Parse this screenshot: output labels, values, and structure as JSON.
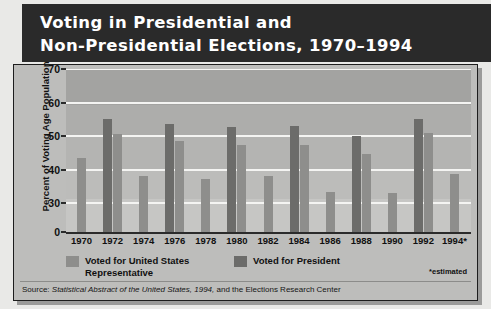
{
  "title": {
    "line1": "Voting in Presidential and",
    "line2": "Non-Presidential Elections, 1970–1994"
  },
  "legend": {
    "house_label": "Voted for United States Representative",
    "president_label": "Voted for President",
    "estimated_note": "*estimated"
  },
  "source": {
    "prefix": "Source:",
    "italic": "Statistical Abstract of the United States, 1994,",
    "suffix": "and the Elections Research Center"
  },
  "colors": {
    "banner": "#2a2a2a",
    "house_bar": "#8e8e8c",
    "president_bar": "#6c6c6a",
    "plot_background": "#b0b0ae",
    "gridline": "#f4f4f2"
  },
  "chart_data": {
    "type": "bar",
    "title": "Voting in Presidential and Non-Presidential Elections, 1970–1994",
    "xlabel": "",
    "ylabel": "Percent of Voting Age Population",
    "ylim": [
      0,
      70
    ],
    "yticks": [
      0,
      30,
      40,
      50,
      60,
      70
    ],
    "axis_break": "between 0 and 30",
    "grid": true,
    "legend_position": "below-axis",
    "categories": [
      "1970",
      "1972",
      "1974",
      "1976",
      "1978",
      "1980",
      "1982",
      "1984",
      "1986",
      "1988",
      "1990",
      "1992",
      "1994*"
    ],
    "series": [
      {
        "name": "Voted for United States Representative",
        "color": "#8e8e8c",
        "values": [
          43.5,
          50.7,
          38.0,
          48.5,
          37.2,
          47.4,
          38.0,
          47.4,
          33.4,
          44.7,
          33.0,
          50.8,
          38.8
        ]
      },
      {
        "name": "Voted for President",
        "color": "#6c6c6a",
        "values": [
          null,
          55.2,
          null,
          53.5,
          null,
          52.6,
          null,
          53.1,
          null,
          50.1,
          null,
          55.0,
          null
        ]
      }
    ],
    "notes": [
      "*estimated"
    ]
  }
}
